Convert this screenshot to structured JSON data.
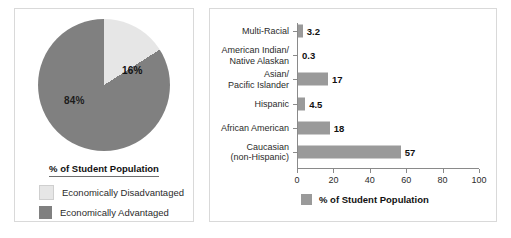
{
  "colors": {
    "dark_gray": "#808080",
    "light_gray": "#e6e6e6",
    "bar_gray": "#9a9a9a",
    "axis": "#8a8a8a",
    "panel_border": "#d9d9d9"
  },
  "pie_panel": {
    "title": "% of Student Population",
    "legend": [
      {
        "label": "Economically Disadvantaged",
        "color": "#e6e6e6"
      },
      {
        "label": "Economically Advantaged",
        "color": "#808080"
      }
    ]
  },
  "bar_panel": {
    "legend": [
      {
        "label": "% of Student Population",
        "color": "#9a9a9a"
      }
    ]
  },
  "chart_data": [
    {
      "type": "pie",
      "title": "% of Student Population",
      "categories": [
        "Economically Disadvantaged",
        "Economically Advantaged"
      ],
      "values": [
        16,
        84
      ],
      "labels": [
        "16%",
        "84%"
      ],
      "colors": [
        "#e6e6e6",
        "#808080"
      ],
      "legend_position": "bottom",
      "start_angle_deg": 0,
      "direction": "clockwise"
    },
    {
      "type": "bar",
      "orientation": "horizontal",
      "title": "",
      "xlabel": "% of Student Population",
      "ylabel": "",
      "xlim": [
        0,
        100
      ],
      "xticks": [
        0,
        20,
        40,
        60,
        80,
        100
      ],
      "xtick_labels": [
        "0",
        "20",
        "40",
        "60",
        "80",
        "100"
      ],
      "grid": false,
      "legend_position": "bottom",
      "categories": [
        "Multi-Racial",
        "American Indian/ Native Alaskan",
        "Asian/ Pacific Islander",
        "Hispanic",
        "African American",
        "Caucasian (non-Hispanic)"
      ],
      "category_lines": [
        [
          "Multi-Racial"
        ],
        [
          "American Indian/",
          "Native Alaskan"
        ],
        [
          "Asian/",
          "Pacific Islander"
        ],
        [
          "Hispanic"
        ],
        [
          "African American"
        ],
        [
          "Caucasian",
          "(non-Hispanic)"
        ]
      ],
      "values": [
        3.2,
        0.3,
        17,
        4.5,
        18,
        57
      ],
      "value_labels": [
        "3.2",
        "0.3",
        "17",
        "4.5",
        "18",
        "57"
      ],
      "bar_color": "#9a9a9a"
    }
  ]
}
